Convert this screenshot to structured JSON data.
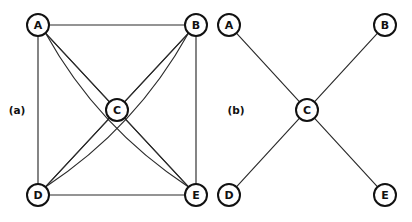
{
  "figure": {
    "background_color": "#ffffff",
    "stroke_color": "#2b2b2b",
    "node_stroke_color": "#111111",
    "node_fill_color": "#ffffff",
    "node_radius": 11,
    "panels": [
      {
        "id": "panel-a",
        "label": "(a)",
        "label_x": 17,
        "label_y": 110,
        "graph_type": "complete-graph",
        "nodes": [
          {
            "id": "A",
            "label": "A",
            "x": 38,
            "y": 25
          },
          {
            "id": "B",
            "label": "B",
            "x": 196,
            "y": 25
          },
          {
            "id": "C",
            "label": "C",
            "x": 117,
            "y": 110
          },
          {
            "id": "D",
            "label": "D",
            "x": 38,
            "y": 195
          },
          {
            "id": "E",
            "label": "E",
            "x": 196,
            "y": 195
          }
        ],
        "edges": [
          {
            "from": "A",
            "to": "B",
            "shape": "line"
          },
          {
            "from": "A",
            "to": "D",
            "shape": "line"
          },
          {
            "from": "B",
            "to": "E",
            "shape": "line"
          },
          {
            "from": "D",
            "to": "E",
            "shape": "line"
          },
          {
            "from": "A",
            "to": "C",
            "shape": "line"
          },
          {
            "from": "B",
            "to": "C",
            "shape": "line"
          },
          {
            "from": "C",
            "to": "D",
            "shape": "line"
          },
          {
            "from": "C",
            "to": "E",
            "shape": "line"
          },
          {
            "from": "A",
            "to": "E",
            "shape": "line"
          },
          {
            "from": "B",
            "to": "D",
            "shape": "line"
          },
          {
            "from": "A",
            "to": "E",
            "shape": "curve",
            "bow": 26
          },
          {
            "from": "B",
            "to": "D",
            "shape": "curve",
            "bow": -26
          }
        ]
      },
      {
        "id": "panel-b",
        "label": "(b)",
        "label_x": 236,
        "label_y": 110,
        "graph_type": "star-graph",
        "nodes": [
          {
            "id": "A",
            "label": "A",
            "x": 229,
            "y": 25
          },
          {
            "id": "B",
            "label": "B",
            "x": 385,
            "y": 25
          },
          {
            "id": "C",
            "label": "C",
            "x": 307,
            "y": 110
          },
          {
            "id": "D",
            "label": "D",
            "x": 229,
            "y": 195
          },
          {
            "id": "E",
            "label": "E",
            "x": 385,
            "y": 195
          }
        ],
        "edges": [
          {
            "from": "C",
            "to": "A",
            "shape": "line"
          },
          {
            "from": "C",
            "to": "B",
            "shape": "line"
          },
          {
            "from": "C",
            "to": "D",
            "shape": "line"
          },
          {
            "from": "C",
            "to": "E",
            "shape": "line"
          }
        ]
      }
    ]
  }
}
